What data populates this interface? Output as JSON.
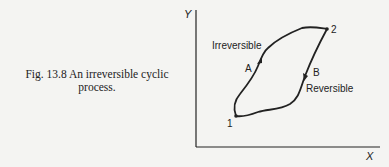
{
  "caption": {
    "figure_number": "Fig. 13.8",
    "line1": "Fig. 13.8  An irreversible cyclic",
    "line2": "process."
  },
  "diagram": {
    "axes": {
      "x_label": "X",
      "y_label": "Y"
    },
    "points": [
      {
        "id": "1",
        "label": "1"
      },
      {
        "id": "2",
        "label": "2"
      }
    ],
    "paths": [
      {
        "id": "A",
        "label": "A",
        "description": "Irreversible",
        "direction": "1 to 2"
      },
      {
        "id": "B",
        "label": "B",
        "description": "Reversible",
        "direction": "2 to 1"
      }
    ],
    "colors": {
      "ink": "#222222",
      "background": "#f4f4f2"
    }
  }
}
